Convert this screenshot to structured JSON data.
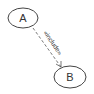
{
  "diagram": {
    "type": "uml-use-case",
    "nodes": [
      {
        "id": "A",
        "label": "A"
      },
      {
        "id": "B",
        "label": "B"
      }
    ],
    "edges": [
      {
        "from": "A",
        "to": "B",
        "label": "«include»",
        "style": "dashed",
        "arrow": "open"
      }
    ]
  }
}
